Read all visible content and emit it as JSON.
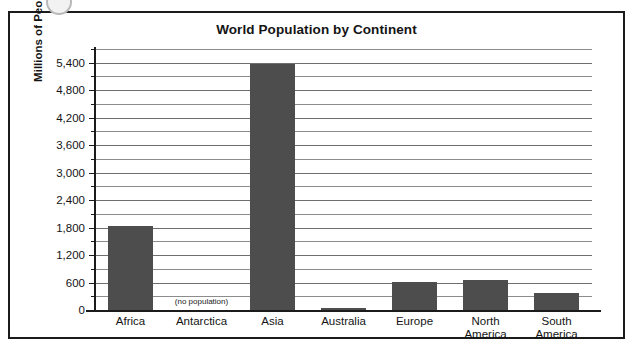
{
  "chart_data": {
    "type": "bar",
    "title": "World Population by Continent",
    "xlabel": "",
    "ylabel": "Millions of People",
    "categories": [
      "Africa",
      "Antarctica",
      "Asia",
      "Australia",
      "Europe",
      "North America",
      "South America"
    ],
    "category_lines": [
      [
        "Africa"
      ],
      [
        "Antarctica"
      ],
      [
        "Asia"
      ],
      [
        "Australia"
      ],
      [
        "Europe"
      ],
      [
        "North",
        "America"
      ],
      [
        "South",
        "America"
      ]
    ],
    "values": [
      1830,
      0,
      5370,
      30,
      620,
      660,
      380
    ],
    "ylim": [
      0,
      5700
    ],
    "y_major_ticks": [
      0,
      600,
      1200,
      1800,
      2400,
      3000,
      3600,
      4200,
      4800,
      5400
    ],
    "y_major_tick_labels": [
      "0",
      "600",
      "1,200",
      "1,800",
      "2,400",
      "3,000",
      "3,600",
      "4,200",
      "4,800",
      "5,400"
    ],
    "y_minor_ticks": [
      300,
      900,
      1500,
      2100,
      2700,
      3300,
      3900,
      4500,
      5100,
      5700
    ],
    "grid": true,
    "legend": false,
    "annotations": [
      {
        "category": "Antarctica",
        "text": "(no population)",
        "value": 0
      }
    ],
    "colors": {
      "bar_fill": "#4d4d4d",
      "gridline": "#6e6e6e",
      "axis": "#1b1b1b",
      "text": "#141414",
      "background": "#ffffff",
      "frame_border": "#1b1b1b"
    }
  }
}
